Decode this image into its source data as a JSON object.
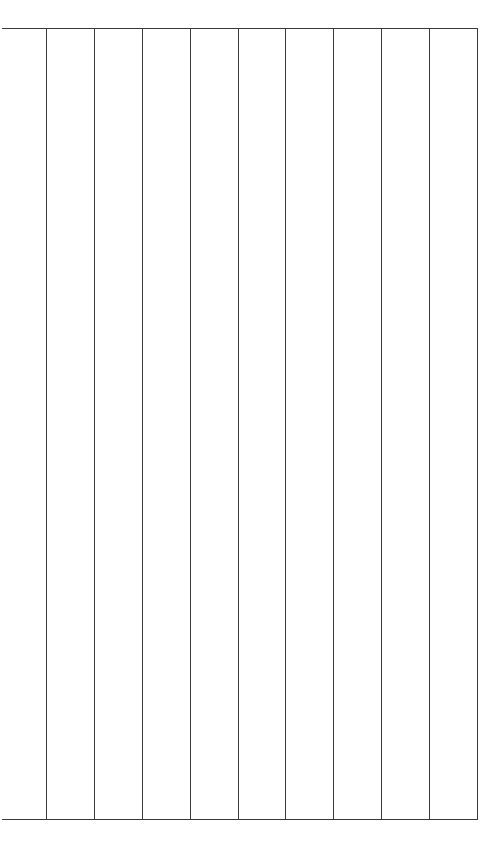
{
  "grid": {
    "line_color": "#3a3a3a",
    "background": "#ffffff",
    "top_rule": {
      "x1": 2,
      "x2": 478,
      "y": 28
    },
    "bottom_rule": {
      "x1": 2,
      "x2": 478,
      "y": 819
    },
    "vertical_dividers_x": [
      46,
      94,
      142,
      190,
      238,
      285,
      333,
      381,
      429,
      477
    ],
    "columns": 10,
    "cells": []
  }
}
